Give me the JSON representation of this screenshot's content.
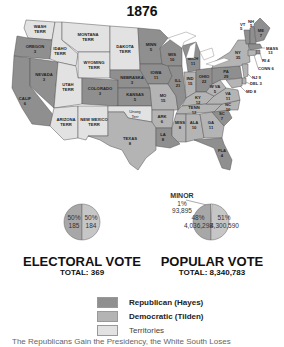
{
  "title": "1876",
  "colors": {
    "republican": "#8f8f8f",
    "democratic": "#b4b4b4",
    "territory": "#e2e2e2",
    "water": "#ffffff",
    "border": "#555555"
  },
  "states": [
    {
      "abbr": "WASH TERR",
      "ev": "",
      "party": "territory"
    },
    {
      "abbr": "OREGON",
      "ev": "3",
      "party": "republican"
    },
    {
      "abbr": "CALIF",
      "ev": "6",
      "party": "republican"
    },
    {
      "abbr": "NEVADA",
      "ev": "3",
      "party": "republican"
    },
    {
      "abbr": "IDAHO TERR",
      "ev": "",
      "party": "territory"
    },
    {
      "abbr": "MONTANA TERR",
      "ev": "",
      "party": "territory"
    },
    {
      "abbr": "WYOMING TERR",
      "ev": "",
      "party": "territory"
    },
    {
      "abbr": "UTAH TERR",
      "ev": "",
      "party": "territory"
    },
    {
      "abbr": "COLORADO",
      "ev": "3",
      "party": "republican"
    },
    {
      "abbr": "ARIZONA TERR",
      "ev": "",
      "party": "territory"
    },
    {
      "abbr": "NEW MEXICO TERR",
      "ev": "",
      "party": "territory"
    },
    {
      "abbr": "DAKOTA TERR",
      "ev": "",
      "party": "territory"
    },
    {
      "abbr": "NEBRASKA",
      "ev": "3",
      "party": "republican"
    },
    {
      "abbr": "KANSAS",
      "ev": "5",
      "party": "republican"
    },
    {
      "abbr": "Unorg Terr",
      "ev": "",
      "party": "territory"
    },
    {
      "abbr": "TEXAS",
      "ev": "8",
      "party": "democratic"
    },
    {
      "abbr": "MINN",
      "ev": "5",
      "party": "republican"
    },
    {
      "abbr": "IOWA",
      "ev": "11",
      "party": "republican"
    },
    {
      "abbr": "MO",
      "ev": "15",
      "party": "democratic"
    },
    {
      "abbr": "ARK",
      "ev": "6",
      "party": "democratic"
    },
    {
      "abbr": "LA",
      "ev": "8",
      "party": "republican"
    },
    {
      "abbr": "WIS",
      "ev": "10",
      "party": "republican"
    },
    {
      "abbr": "ILL",
      "ev": "21",
      "party": "republican"
    },
    {
      "abbr": "MICH",
      "ev": "11",
      "party": "republican"
    },
    {
      "abbr": "IND",
      "ev": "15",
      "party": "democratic"
    },
    {
      "abbr": "OHIO",
      "ev": "22",
      "party": "republican"
    },
    {
      "abbr": "KY",
      "ev": "12",
      "party": "democratic"
    },
    {
      "abbr": "TENN",
      "ev": "12",
      "party": "democratic"
    },
    {
      "abbr": "MISS",
      "ev": "8",
      "party": "democratic"
    },
    {
      "abbr": "ALA",
      "ev": "10",
      "party": "democratic"
    },
    {
      "abbr": "GA",
      "ev": "11",
      "party": "democratic"
    },
    {
      "abbr": "FLA",
      "ev": "4",
      "party": "republican"
    },
    {
      "abbr": "SC",
      "ev": "7",
      "party": "republican"
    },
    {
      "abbr": "NC",
      "ev": "10",
      "party": "democratic"
    },
    {
      "abbr": "VA",
      "ev": "11",
      "party": "democratic"
    },
    {
      "abbr": "W VA",
      "ev": "5",
      "party": "democratic"
    },
    {
      "abbr": "PA",
      "ev": "29",
      "party": "republican"
    },
    {
      "abbr": "NY",
      "ev": "35",
      "party": "democratic"
    },
    {
      "abbr": "VT",
      "ev": "5",
      "party": "republican"
    },
    {
      "abbr": "NH",
      "ev": "5",
      "party": "republican"
    },
    {
      "abbr": "ME",
      "ev": "7",
      "party": "republican"
    },
    {
      "abbr": "MASS",
      "ev": "13",
      "party": "republican"
    },
    {
      "abbr": "RI",
      "ev": "4",
      "party": "republican"
    },
    {
      "abbr": "CONN",
      "ev": "6",
      "party": "democratic"
    },
    {
      "abbr": "NJ",
      "ev": "9",
      "party": "democratic"
    },
    {
      "abbr": "DEL",
      "ev": "3",
      "party": "democratic"
    },
    {
      "abbr": "MD",
      "ev": "8",
      "party": "democratic"
    }
  ],
  "electoral": {
    "heading": "ELECTORAL VOTE",
    "total_label": "TOTAL: 369",
    "rep_pct": "50%",
    "rep_votes": "185",
    "dem_pct": "50%",
    "dem_votes": "184"
  },
  "popular": {
    "heading": "POPULAR VOTE",
    "total_label": "TOTAL: 8,340,783",
    "rep_pct": "48%",
    "rep_votes": "4,036,298",
    "dem_pct": "51%",
    "dem_votes": "4,300,590",
    "minor_label": "MINOR",
    "minor_pct": "1%",
    "minor_votes": "93,895"
  },
  "legend": [
    {
      "label": "Republican (Hayes)",
      "party": "republican"
    },
    {
      "label": "Democratic (Tilden)",
      "party": "democratic"
    },
    {
      "label": "Territories",
      "party": "territory"
    }
  ],
  "caption": "The Republicans Gain the Presidency, the White South Loses"
}
